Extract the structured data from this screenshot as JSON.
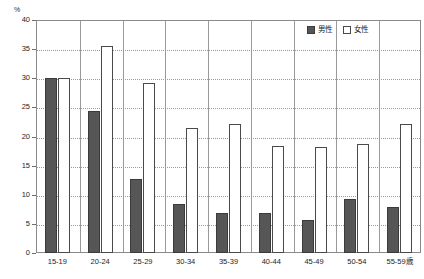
{
  "chart_data": {
    "type": "bar",
    "title": "",
    "subtitle": "",
    "xlabel": "",
    "ylabel": "",
    "unit_label": "%",
    "categories": [
      "15-19",
      "20-24",
      "25-29",
      "30-34",
      "35-39",
      "40-44",
      "45-49",
      "50-54",
      "55-59歳"
    ],
    "series": [
      {
        "name": "男性",
        "color": "#565656",
        "values": [
          30.0,
          24.3,
          12.7,
          8.4,
          6.9,
          6.9,
          5.7,
          9.3,
          7.9
        ]
      },
      {
        "name": "女性",
        "color": "#ffffff",
        "values": [
          30.0,
          35.6,
          29.2,
          21.4,
          22.1,
          18.4,
          18.2,
          18.8,
          22.1
        ]
      }
    ],
    "ylim": [
      0,
      40
    ],
    "yticks": [
      0,
      5,
      10,
      15,
      20,
      25,
      30,
      35,
      40
    ],
    "ytick_labels": [
      "0",
      "5",
      "10",
      "15",
      "20",
      "25",
      "30",
      "35",
      "40"
    ],
    "grid": true,
    "grid_style": "dotted-horizontal",
    "legend_position": "top-right",
    "legend": [
      {
        "label": "男性",
        "swatch": "filled-dark"
      },
      {
        "label": "女性",
        "swatch": "outline-white"
      }
    ],
    "colors": {
      "male_fill": "#565656",
      "male_border": "#3b3b3b",
      "female_fill": "#ffffff",
      "female_border": "#4a4a4a",
      "axis": "#8a8a8a",
      "grid": "#9a9a9a",
      "text": "#1d1d1d",
      "background": "#ffffff"
    }
  }
}
